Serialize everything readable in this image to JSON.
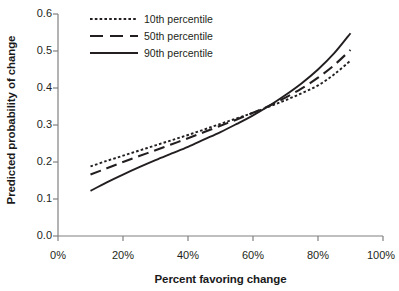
{
  "chart_data": {
    "type": "line",
    "title": "",
    "xlabel": "Percent favoring change",
    "ylabel": "Predicted probability of change",
    "xlim": [
      0,
      100
    ],
    "ylim": [
      0.0,
      0.6
    ],
    "grid": false,
    "legend_position": "top-left-inside",
    "x_tick_labels": [
      "0%",
      "20%",
      "40%",
      "60%",
      "80%",
      "100%"
    ],
    "x_tick_values": [
      0,
      20,
      40,
      60,
      80,
      100
    ],
    "y_tick_labels": [
      "0.0",
      "0.1",
      "0.2",
      "0.3",
      "0.4",
      "0.5",
      "0.6"
    ],
    "y_tick_values": [
      0.0,
      0.1,
      0.2,
      0.3,
      0.4,
      0.5,
      0.6
    ],
    "x": [
      10,
      15,
      20,
      25,
      30,
      35,
      40,
      45,
      50,
      55,
      60,
      65,
      70,
      75,
      80,
      85,
      90
    ],
    "series": [
      {
        "name": "10th percentile",
        "style": "dotted",
        "color": "#231f20",
        "values": [
          0.188,
          0.203,
          0.217,
          0.231,
          0.245,
          0.259,
          0.273,
          0.288,
          0.303,
          0.318,
          0.333,
          0.35,
          0.367,
          0.386,
          0.407,
          0.437,
          0.474
        ]
      },
      {
        "name": "50th percentile",
        "style": "dashed",
        "color": "#231f20",
        "values": [
          0.166,
          0.183,
          0.2,
          0.216,
          0.232,
          0.248,
          0.264,
          0.281,
          0.298,
          0.315,
          0.333,
          0.352,
          0.374,
          0.399,
          0.428,
          0.462,
          0.503
        ]
      },
      {
        "name": "90th percentile",
        "style": "solid",
        "color": "#231f20",
        "values": [
          0.122,
          0.145,
          0.166,
          0.186,
          0.205,
          0.223,
          0.241,
          0.261,
          0.281,
          0.303,
          0.326,
          0.352,
          0.381,
          0.413,
          0.45,
          0.494,
          0.548
        ]
      }
    ],
    "crossing_point": {
      "x": 64,
      "y": 0.348
    }
  },
  "legend": {
    "items": [
      {
        "label": "10th percentile"
      },
      {
        "label": "50th percentile"
      },
      {
        "label": "90th percentile"
      }
    ]
  },
  "axes": {
    "x_title": "Percent favoring change",
    "y_title": "Predicted probability of change"
  }
}
